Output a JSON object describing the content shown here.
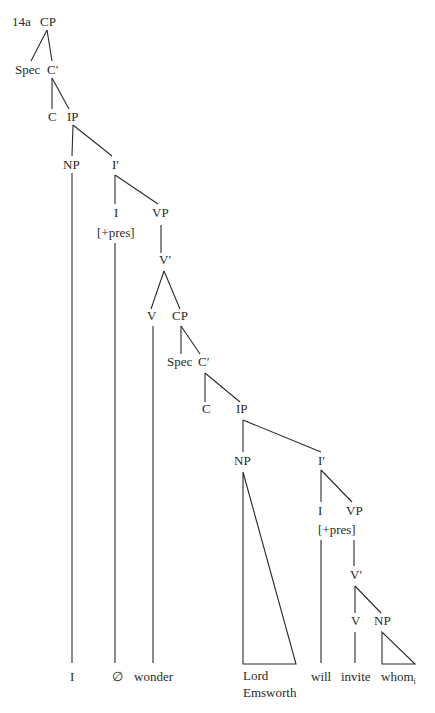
{
  "example_label": "14a",
  "nodes": {
    "cp1": "CP",
    "spec1": "Spec",
    "cbar1": "C′",
    "c1": "C",
    "ip1": "IP",
    "np1": "NP",
    "ibar1": "I′",
    "i1": "I",
    "i1_feature": "[+pres]",
    "vp1": "VP",
    "vbar1": "V′",
    "v1": "V",
    "cp2": "CP",
    "spec2": "Spec",
    "cbar2": "C′",
    "c2": "C",
    "ip2": "IP",
    "np2": "NP",
    "ibar2": "I′",
    "i2": "I",
    "i2_feature": "[+pres]",
    "vp2": "VP",
    "vbar2": "V′",
    "v2": "V",
    "np3": "NP"
  },
  "leaves": {
    "pronoun_i": "I",
    "null_infl": "∅",
    "wonder": "wonder",
    "lord": "Lord",
    "emsworth": "Emsworth",
    "will": "will",
    "invite": "invite",
    "whom": "whom",
    "whom_index": "i"
  }
}
